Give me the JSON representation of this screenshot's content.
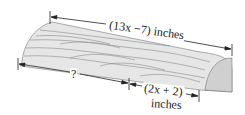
{
  "figure": {
    "labels": {
      "top_length": "(13x −7) inches",
      "bottom_unknown": "?",
      "bottom_known_line1": "(2x + 2)",
      "bottom_known_line2": "inches"
    },
    "colors": {
      "wood_fill": "#e6e6e6",
      "grain": "#8a8a8a",
      "line": "#222222"
    }
  }
}
